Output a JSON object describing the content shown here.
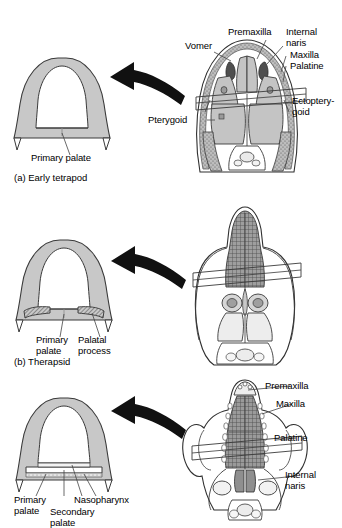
{
  "figure": {
    "type": "anatomical-diagram",
    "background": "#ffffff",
    "bone_fill": "#c8c8c8",
    "hatch_dark": "#6e6e6e",
    "outline": "#3a3a3a",
    "arrow_color": "#111111"
  },
  "panels": [
    {
      "id": "a",
      "caption": "(a) Early tetrapod",
      "section_labels": [
        {
          "name": "primary-palate",
          "text": "Primary palate"
        }
      ],
      "skull_labels": [
        {
          "name": "vomer",
          "text": "Vomer"
        },
        {
          "name": "premaxilla",
          "text": "Premaxilla"
        },
        {
          "name": "internal-naris",
          "text": "Internal\nnaris"
        },
        {
          "name": "maxilla",
          "text": "Maxilla"
        },
        {
          "name": "palatine",
          "text": "Palatine"
        },
        {
          "name": "ectopterygoid",
          "text": "Ectoptery-\ngoid"
        },
        {
          "name": "pterygoid",
          "text": "Pterygoid"
        }
      ]
    },
    {
      "id": "b",
      "caption": "(b) Therapsid",
      "section_labels": [
        {
          "name": "primary-palate",
          "text": "Primary\npalate"
        },
        {
          "name": "palatal-process",
          "text": "Palatal\nprocess"
        }
      ],
      "skull_labels": []
    },
    {
      "id": "c",
      "caption": "(c) Mammal",
      "section_labels": [
        {
          "name": "primary-palate",
          "text": "Primary\npalate"
        },
        {
          "name": "secondary-palate",
          "text": "Secondary\npalate"
        },
        {
          "name": "nasopharynx",
          "text": "Nasopharynx"
        }
      ],
      "skull_labels": [
        {
          "name": "premaxilla",
          "text": "Premaxilla"
        },
        {
          "name": "maxilla",
          "text": "Maxilla"
        },
        {
          "name": "palatine",
          "text": "Palatine"
        },
        {
          "name": "internal-naris",
          "text": "Internal\nnaris"
        }
      ]
    }
  ]
}
